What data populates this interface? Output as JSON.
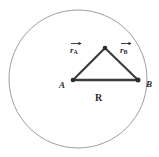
{
  "figure": {
    "type": "geometry-diagram",
    "background_color": "#ffffff",
    "canvas": {
      "width": 159,
      "height": 157
    },
    "circle": {
      "name": "outer-circle",
      "center_x": 78,
      "center_y": 79,
      "radius": 69,
      "stroke_color": "#8d8d8d",
      "stroke_width": 0.8,
      "fill": "none"
    },
    "points": [
      {
        "id": "A",
        "label": "A",
        "x": 73,
        "y": 80,
        "label_x": 60,
        "label_y": 85,
        "dot_radius": 2.2
      },
      {
        "id": "P",
        "label": "",
        "x": 105,
        "y": 48,
        "dot_radius": 2.2
      },
      {
        "id": "B",
        "label": "B",
        "x": 138,
        "y": 80,
        "label_x": 146,
        "label_y": 84,
        "dot_radius": 2.4
      }
    ],
    "segments": [
      {
        "name": "segment-a-to-apex",
        "from": "A",
        "to": "P",
        "stroke_color": "#3a3a3a",
        "stroke_width": 2.1
      },
      {
        "name": "segment-apex-to-b",
        "from": "P",
        "to": "B",
        "stroke_color": "#3a3a3a",
        "stroke_width": 2.1
      },
      {
        "name": "segment-a-to-b",
        "from": "A",
        "to": "B",
        "stroke_color": "#3a3a3a",
        "stroke_width": 2.3
      }
    ],
    "labels": {
      "point_a": "A",
      "point_b": "B",
      "radius": "R",
      "vector_a_symbol": "r",
      "vector_a_subscript": "A",
      "vector_b_symbol": "r",
      "vector_b_subscript": "B"
    },
    "label_positions": {
      "radius": {
        "x": 94,
        "y": 93
      },
      "vector_a": {
        "x": 69,
        "y": 42
      },
      "vector_b": {
        "x": 119,
        "y": 42
      }
    },
    "text_color": "#2b2b2b"
  }
}
